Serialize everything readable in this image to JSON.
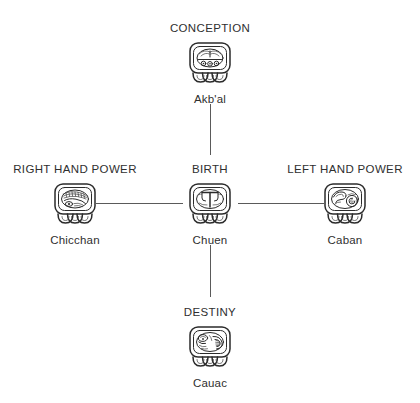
{
  "diagram": {
    "type": "cross-diagram",
    "background_color": "#ffffff",
    "ink_color": "#2b2b2b",
    "line_color": "#5a5a5a",
    "nodes": [
      {
        "id": "conception",
        "position": "top",
        "title": "CONCEPTION",
        "name": "Akb'al",
        "glyph": "akbal-glyph"
      },
      {
        "id": "right-hand-power",
        "position": "left",
        "title": "RIGHT HAND POWER",
        "name": "Chicchan",
        "glyph": "chicchan-glyph"
      },
      {
        "id": "birth",
        "position": "center",
        "title": "BIRTH",
        "name": "Chuen",
        "glyph": "chuen-glyph"
      },
      {
        "id": "left-hand-power",
        "position": "right",
        "title": "LEFT HAND POWER",
        "name": "Caban",
        "glyph": "caban-glyph"
      },
      {
        "id": "destiny",
        "position": "bottom",
        "title": "DESTINY",
        "name": "Cauac",
        "glyph": "cauac-glyph"
      }
    ],
    "connectors": [
      {
        "id": "conception-to-birth",
        "from": "conception",
        "to": "birth",
        "orientation": "vertical"
      },
      {
        "id": "birth-to-destiny",
        "from": "birth",
        "to": "destiny",
        "orientation": "vertical"
      },
      {
        "id": "right-hand-power-to-birth",
        "from": "right-hand-power",
        "to": "birth",
        "orientation": "horizontal"
      },
      {
        "id": "birth-to-left-hand-power",
        "from": "birth",
        "to": "left-hand-power",
        "orientation": "horizontal"
      }
    ]
  }
}
